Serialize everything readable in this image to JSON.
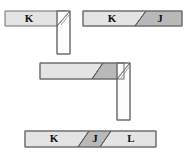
{
  "figure": {
    "background_color": "#ffffff",
    "colors": {
      "light_fill": "#e4e4e4",
      "dark_fill": "#b9b9b9",
      "white_fill": "#fdfdfd",
      "stroke": "#6e6e6e",
      "cut_line": "#5a5a5a",
      "label_text": "#111111"
    }
  },
  "shapes": [
    {
      "id": "shape-top-left",
      "name": "L-corner joint with member K",
      "type": "L-corner",
      "labels": [
        "K"
      ],
      "segments": [
        {
          "key": "K",
          "label": "K",
          "shade": "light",
          "orientation": "horizontal"
        },
        {
          "key": "post",
          "label": "",
          "shade": "white",
          "orientation": "vertical"
        }
      ],
      "has_mitre_hatch": true
    },
    {
      "id": "shape-top-right",
      "name": "Straight member with scarf joint K to J",
      "type": "straight-bar",
      "labels": [
        "K",
        "J"
      ],
      "segments": [
        {
          "key": "K",
          "label": "K",
          "shade": "light",
          "orientation": "horizontal"
        },
        {
          "key": "J",
          "label": "J",
          "shade": "dark",
          "orientation": "horizontal"
        }
      ],
      "has_mitre_hatch": false
    },
    {
      "id": "shape-middle",
      "name": "L-corner joint with scarf cut and vertical post",
      "type": "L-corner",
      "labels": [],
      "segments": [
        {
          "key": "light",
          "label": "",
          "shade": "light",
          "orientation": "horizontal"
        },
        {
          "key": "dark",
          "label": "",
          "shade": "dark",
          "orientation": "horizontal"
        },
        {
          "key": "post",
          "label": "",
          "shade": "white",
          "orientation": "vertical"
        }
      ],
      "has_mitre_hatch": true
    },
    {
      "id": "shape-bottom",
      "name": "Straight member with two scarf joints K, J, L",
      "type": "straight-bar",
      "labels": [
        "K",
        "J",
        "L"
      ],
      "segments": [
        {
          "key": "K",
          "label": "K",
          "shade": "light",
          "orientation": "horizontal"
        },
        {
          "key": "J",
          "label": "J",
          "shade": "dark",
          "orientation": "horizontal"
        },
        {
          "key": "L",
          "label": "L",
          "shade": "light",
          "orientation": "horizontal"
        }
      ],
      "has_mitre_hatch": false
    }
  ],
  "text_labels": {
    "tl_k": "K",
    "tr_k": "K",
    "tr_j": "J",
    "b_k": "K",
    "b_j": "J",
    "b_l": "L"
  }
}
